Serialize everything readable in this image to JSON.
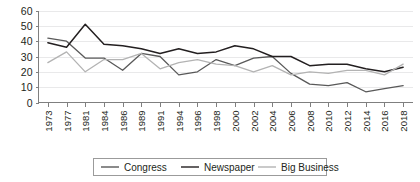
{
  "chart_data": {
    "type": "line",
    "title": "",
    "subtitle": "",
    "xlabel": "",
    "ylabel": "",
    "ylim": [
      0,
      60
    ],
    "yticks": [
      0,
      10,
      20,
      30,
      40,
      50,
      60
    ],
    "grid": true,
    "legend_position": "bottom-center",
    "categories": [
      "1973",
      "1977",
      "1981",
      "1984",
      "1986",
      "1989",
      "1991",
      "1994",
      "1996",
      "1998",
      "2000",
      "2002",
      "2004",
      "2006",
      "2008",
      "2010",
      "2012",
      "2014",
      "2016",
      "2018"
    ],
    "x_tick_labels": [
      "1973",
      "1977",
      "1981",
      "1984",
      "1986",
      "1989",
      "1991",
      "1994",
      "1996",
      "1998",
      "2000",
      "2002",
      "2004",
      "2006",
      "2008",
      "2010",
      "2012",
      "2014",
      "2016",
      "2018"
    ],
    "y_tick_labels": [
      "0",
      "10",
      "20",
      "30",
      "40",
      "50",
      "60"
    ],
    "series": [
      {
        "name": "Congress",
        "color": "#595959",
        "values": [
          42,
          40,
          29,
          29,
          21,
          32,
          30,
          18,
          20,
          28,
          24,
          29,
          30,
          19,
          12,
          11,
          13,
          7,
          9,
          11
        ]
      },
      {
        "name": "Newspaper",
        "color": "#231f20",
        "values": [
          39,
          36,
          51,
          38,
          37,
          35,
          32,
          35,
          32,
          33,
          37,
          35,
          30,
          30,
          24,
          25,
          25,
          22,
          20,
          23
        ]
      },
      {
        "name": "Big Business",
        "color": "#b3b3b3",
        "values": [
          26,
          33,
          20,
          28,
          28,
          32,
          22,
          26,
          28,
          25,
          24,
          20,
          24,
          18,
          20,
          19,
          21,
          21,
          18,
          25
        ]
      }
    ]
  },
  "legend": {
    "items": [
      {
        "label": "Congress",
        "color": "#595959"
      },
      {
        "label": "Newspaper",
        "color": "#231f20"
      },
      {
        "label": "Big Business",
        "color": "#b3b3b3"
      }
    ]
  }
}
